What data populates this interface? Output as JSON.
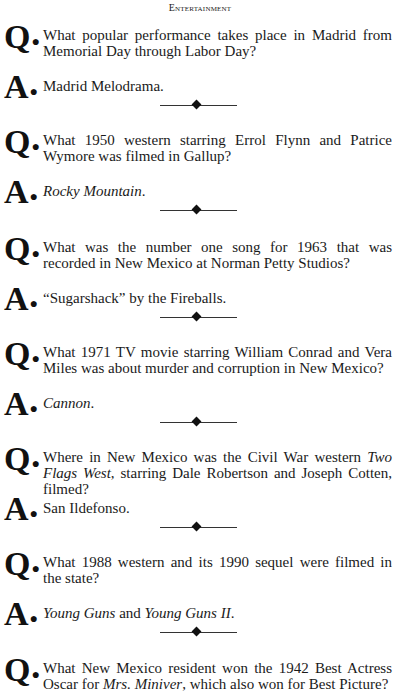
{
  "header": {
    "section_title": "Entertainment"
  },
  "qa_items": [
    {
      "q_label": "Q",
      "q_parts": [
        {
          "t": "What popular performance takes place in Madrid from Memorial Day through Labor Day?",
          "i": false
        }
      ],
      "a_label": "A",
      "a_parts": [
        {
          "t": "Madrid Melodrama.",
          "i": false
        }
      ]
    },
    {
      "q_label": "Q",
      "q_parts": [
        {
          "t": "What 1950 western starring Errol Flynn and Patrice Wymore was filmed in Gallup?",
          "i": false
        }
      ],
      "a_label": "A",
      "a_parts": [
        {
          "t": "Rocky Mountain",
          "i": true
        },
        {
          "t": ".",
          "i": false
        }
      ]
    },
    {
      "q_label": "Q",
      "q_parts": [
        {
          "t": "What was the number one song for 1963 that was recorded in New Mexico at Norman Petty Studios?",
          "i": false
        }
      ],
      "a_label": "A",
      "a_parts": [
        {
          "t": "“Sugarshack” by the Fireballs.",
          "i": false
        }
      ]
    },
    {
      "q_label": "Q",
      "q_parts": [
        {
          "t": "What 1971 TV movie starring William Conrad and Vera Miles was about murder and corruption in New Mexico?",
          "i": false
        }
      ],
      "a_label": "A",
      "a_parts": [
        {
          "t": "Cannon",
          "i": true
        },
        {
          "t": ".",
          "i": false
        }
      ]
    },
    {
      "q_label": "Q",
      "q_parts": [
        {
          "t": "Where in New Mexico was the Civil War western ",
          "i": false
        },
        {
          "t": "Two Flags West",
          "i": true
        },
        {
          "t": ", starring Dale Robertson and Joseph Cotten, filmed?",
          "i": false
        }
      ],
      "a_label": "A",
      "a_parts": [
        {
          "t": "San Ildefonso.",
          "i": false
        }
      ]
    },
    {
      "q_label": "Q",
      "q_parts": [
        {
          "t": "What 1988 western and its 1990 sequel were filmed in the state?",
          "i": false
        }
      ],
      "a_label": "A",
      "a_parts": [
        {
          "t": "Young Guns",
          "i": true
        },
        {
          "t": " and ",
          "i": false
        },
        {
          "t": "Young Guns II",
          "i": true
        },
        {
          "t": ".",
          "i": false
        }
      ]
    },
    {
      "q_label": "Q",
      "q_parts": [
        {
          "t": "What New Mexico resident won the 1942 Best Actress Oscar for ",
          "i": false
        },
        {
          "t": "Mrs. Miniver",
          "i": true
        },
        {
          "t": ", which also won for Best Picture?",
          "i": false
        }
      ],
      "a_label": "A",
      "a_parts": []
    }
  ],
  "layout": {
    "q_tops": [
      22,
      127,
      234,
      339,
      444,
      549,
      655
    ],
    "a_tops": [
      72,
      177,
      284,
      389,
      494,
      599,
      700
    ],
    "divider_tops": [
      105,
      210,
      317,
      422,
      527,
      632
    ]
  }
}
